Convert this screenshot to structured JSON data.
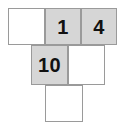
{
  "figure": {
    "name": "number-grid-shape",
    "background_color": "#ffffff",
    "border_color": "#9a9a9a",
    "shaded_color": "#d6d6d6",
    "blank_color": "#ffffff",
    "text_color": "#111111",
    "rows": [
      {
        "row_name": "top-row",
        "cells": [
          {
            "id": "r1c1",
            "label": "",
            "shaded": false,
            "x": 8,
            "y": 8,
            "w": 37,
            "h": 37
          },
          {
            "id": "r1c2",
            "label": "1",
            "shaded": true,
            "x": 45,
            "y": 8,
            "w": 36,
            "h": 37
          },
          {
            "id": "r1c3",
            "label": "4",
            "shaded": true,
            "x": 81,
            "y": 8,
            "w": 36,
            "h": 37
          }
        ]
      },
      {
        "row_name": "middle-row",
        "cells": [
          {
            "id": "r2c1",
            "label": "10",
            "shaded": true,
            "x": 31,
            "y": 45,
            "w": 37,
            "h": 40
          },
          {
            "id": "r2c2",
            "label": "",
            "shaded": false,
            "x": 68,
            "y": 45,
            "w": 37,
            "h": 40
          }
        ]
      },
      {
        "row_name": "bottom-row",
        "cells": [
          {
            "id": "r3c1",
            "label": "",
            "shaded": false,
            "x": 45,
            "y": 85,
            "w": 38,
            "h": 37
          }
        ]
      }
    ]
  }
}
